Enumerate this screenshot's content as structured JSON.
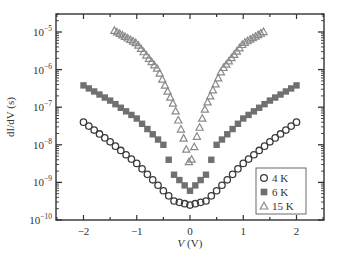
{
  "chart_data": {
    "type": "scatter",
    "title": "",
    "xlabel": "V (V)",
    "ylabel": "dI/dV (s)",
    "xlim": [
      -2.5,
      2.5
    ],
    "ylim_log10": [
      -10,
      -4.5
    ],
    "yscale": "log",
    "x_ticks": [
      -2,
      -1,
      0,
      1,
      2
    ],
    "x_tick_labels": [
      "−2",
      "−1",
      "0",
      "1",
      "2"
    ],
    "y_ticks_exp": [
      -10,
      -9,
      -8,
      -7,
      -6,
      -5
    ],
    "y_tick_base": "10",
    "grid": false,
    "legend_position": "lower right",
    "legend": [
      "4 K",
      "6 K",
      "15 K"
    ],
    "series": [
      {
        "name": "4 K",
        "marker": "open-circle",
        "color": "#3a3a3a",
        "V": [
          -2.0,
          -1.5,
          -1.0,
          -0.5,
          -0.3,
          0.0,
          0.3,
          0.5,
          1.0,
          1.5,
          2.0
        ],
        "dIdV": [
          4e-08,
          1.2e-08,
          3.2e-09,
          6e-10,
          3.2e-10,
          2.5e-10,
          3.2e-10,
          6e-10,
          3.2e-09,
          1.2e-08,
          4e-08
        ]
      },
      {
        "name": "6 K",
        "marker": "filled-square",
        "color": "#707070",
        "V": [
          -2.0,
          -1.5,
          -1.0,
          -0.5,
          -0.3,
          0.0,
          0.3,
          0.5,
          1.0,
          1.5,
          2.0
        ],
        "dIdV": [
          3.8e-07,
          1.5e-07,
          5e-08,
          1e-08,
          1.6e-09,
          6e-10,
          1.6e-09,
          1e-08,
          5e-08,
          1.5e-07,
          3.8e-07
        ]
      },
      {
        "name": "15 K",
        "marker": "open-triangle",
        "color": "#8a8a8a",
        "V": [
          -1.42,
          -1.0,
          -0.6,
          -0.3,
          -0.1,
          0.0,
          0.1,
          0.3,
          0.6,
          1.0,
          1.42
        ],
        "dIdV": [
          1.1e-05,
          5e-06,
          1e-06,
          1.1e-07,
          1.2e-08,
          2.6e-09,
          1.2e-08,
          1.1e-07,
          1e-06,
          5e-06,
          1.1e-05
        ]
      }
    ]
  },
  "axes": {
    "y_title": "dI/dV (s)",
    "x_title_italic": "V",
    "x_title_unit": " (V)"
  }
}
